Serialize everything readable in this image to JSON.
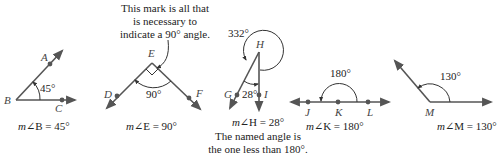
{
  "figures": [
    {
      "id": "B",
      "vertex": "B",
      "points": [
        "A",
        "C"
      ],
      "angle_label": "45°",
      "caption_m": "m",
      "caption_rest": "∠B = 45°"
    },
    {
      "id": "E",
      "vertex": "E",
      "points": [
        "D",
        "F"
      ],
      "angle_label": "90°",
      "caption_m": "m",
      "caption_rest": "∠E = 90°",
      "note_lines": [
        "This mark is all that",
        "is necessary to",
        "indicate a 90° angle."
      ]
    },
    {
      "id": "H",
      "vertex": "H",
      "points": [
        "G",
        "I"
      ],
      "angle_label": "28°",
      "reflex_label": "332°",
      "caption_m": "m",
      "caption_rest": "∠H = 28°",
      "note_lines": [
        "The named angle is",
        "the one less than 180°."
      ]
    },
    {
      "id": "K",
      "vertex": "K",
      "points": [
        "J",
        "L"
      ],
      "angle_label": "180°",
      "caption_m": "m",
      "caption_rest": "∠K = 180°"
    },
    {
      "id": "M",
      "vertex": "M",
      "points": [],
      "angle_label": "130°",
      "caption_m": "m",
      "caption_rest": "∠M = 130°"
    }
  ],
  "colors": {
    "ray": "#555555",
    "arc": "#333333",
    "text": "#222222"
  }
}
